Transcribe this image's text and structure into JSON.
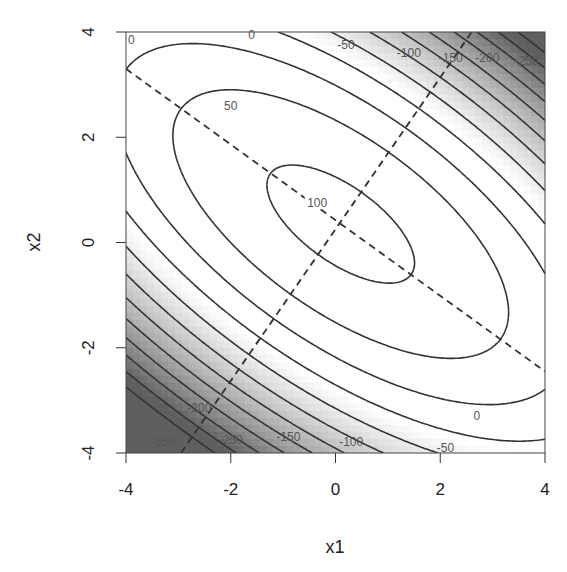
{
  "chart_data": {
    "type": "contour",
    "title": "",
    "xlabel": "x1",
    "ylabel": "x2",
    "xlim": [
      -4,
      4
    ],
    "ylim": [
      -4,
      4
    ],
    "xticks": [
      -4,
      -2,
      0,
      2,
      4
    ],
    "yticks": [
      -4,
      -2,
      0,
      2,
      4
    ],
    "xtick_labels": [
      "-4",
      "-2",
      "0",
      "2",
      "4"
    ],
    "ytick_labels": [
      "-4",
      "-2",
      "0",
      "2",
      "4"
    ],
    "grid": false,
    "legend": null,
    "contour_levels": [
      100,
      50,
      0,
      -50,
      -100,
      -150,
      -200,
      -250,
      -300,
      -350,
      -400,
      -450
    ],
    "contour_labels_shown": [
      {
        "text": "100",
        "x": -0.35,
        "y": 0.75
      },
      {
        "text": "50",
        "x": -2.0,
        "y": 2.6
      },
      {
        "text": "0",
        "x": -3.9,
        "y": 3.85
      },
      {
        "text": "0",
        "x": -1.6,
        "y": 3.95
      },
      {
        "text": "0",
        "x": 2.7,
        "y": -3.3
      },
      {
        "text": "-50",
        "x": 0.2,
        "y": 3.75
      },
      {
        "text": "-100",
        "x": 1.4,
        "y": 3.6
      },
      {
        "text": "-150",
        "x": 2.2,
        "y": 3.5
      },
      {
        "text": "-200",
        "x": 2.9,
        "y": 3.5
      },
      {
        "text": "-250",
        "x": 3.65,
        "y": 3.45
      },
      {
        "text": "-50",
        "x": 2.1,
        "y": -3.9
      },
      {
        "text": "-100",
        "x": 0.3,
        "y": -3.8
      },
      {
        "text": "-150",
        "x": -0.9,
        "y": -3.7
      },
      {
        "text": "-200",
        "x": -2.6,
        "y": -3.15
      },
      {
        "text": "-250",
        "x": -2.0,
        "y": -3.75
      },
      {
        "text": "-350",
        "x": -3.3,
        "y": -3.8
      }
    ],
    "surface_model": {
      "form": "f = peak - a*u^2 - b*v^2 (u along major axis, v along minor axis)",
      "peak": 112,
      "center": [
        0.1,
        0.35
      ],
      "major_axis_slope": -0.71,
      "a": 4.4,
      "b": 23
    },
    "dashed_lines": [
      {
        "name": "major-axis",
        "from": [
          -4,
          3.3
        ],
        "to": [
          4,
          -2.45
        ]
      },
      {
        "name": "minor-axis",
        "from": [
          -2.95,
          -4
        ],
        "to": [
          2.6,
          4
        ]
      }
    ],
    "fill": "grayscale shading: white for high values, darker gray for lower values"
  }
}
